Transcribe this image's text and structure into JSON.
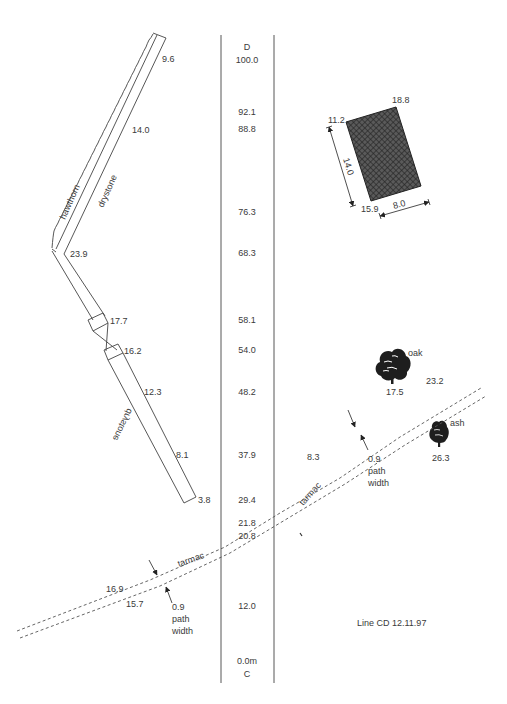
{
  "survey": {
    "title": "Line CD 12.11.97",
    "line_start_label": "C",
    "line_end_label": "D",
    "unit_label": "0.0m",
    "chainages": [
      "100.0",
      "92.1",
      "88.8",
      "76.3",
      "68.3",
      "58.1",
      "54.0",
      "48.2",
      "37.9",
      "29.4",
      "21.8",
      "20.8",
      "12.0",
      "0.0m"
    ]
  },
  "wall": {
    "upper_label": "drystone",
    "hedge_label": "hawthorn",
    "lower_label": "drystone",
    "offsets": {
      "top": "9.6",
      "upper_mid": "14.0",
      "bend": "23.9",
      "gap_top": "17.7",
      "gap_bottom": "16.2",
      "lower_mid": "12.3",
      "lower_2": "8.1",
      "bottom": "3.8"
    }
  },
  "building": {
    "corner_tl": "11.2",
    "corner_tr": "18.8",
    "corner_bl": "15.9",
    "length": "14.0",
    "width": "8.0"
  },
  "trees": [
    {
      "name": "oak",
      "offset": "17.5"
    },
    {
      "name": "ash",
      "offset": "26.3"
    }
  ],
  "path": {
    "surface_label": "tarmac",
    "offsets": {
      "upper_right": "23.2",
      "mid": "8.3",
      "lower_left_top": "16.9",
      "lower_left_bottom": "15.7"
    },
    "width_notes": [
      {
        "value": "0.9",
        "line1": "path",
        "line2": "width"
      },
      {
        "value": "0.9",
        "line1": "path",
        "line2": "width"
      }
    ]
  }
}
